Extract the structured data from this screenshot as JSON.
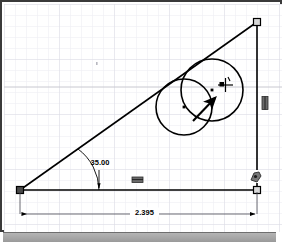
{
  "window": {
    "title": "sketch-canvas",
    "background_color": "#ffffff",
    "frame_color": "#3a3a3a",
    "grid_color": "#e8e8ee",
    "grid_major_color": "#d2d2dc",
    "geometry_color": "#000000",
    "statusbar_color": "#a8a8a8"
  },
  "grid": {
    "minor_spacing": 11,
    "major_spacing": 55,
    "visible": true
  },
  "sketch": {
    "entities": [
      {
        "name": "horizontal-line",
        "type": "line",
        "x1": 16,
        "y1": 186,
        "x2": 253,
        "y2": 186
      },
      {
        "name": "vertical-line",
        "type": "line",
        "x1": 253,
        "y1": 186,
        "x2": 253,
        "y2": 18
      },
      {
        "name": "hypotenuse-line",
        "type": "line",
        "x1": 16,
        "y1": 186,
        "x2": 253,
        "y2": 18
      },
      {
        "name": "left-circle",
        "type": "circle",
        "cx": 180,
        "cy": 103,
        "r": 28
      },
      {
        "name": "right-circle",
        "type": "circle",
        "cx": 208,
        "cy": 86,
        "r": 31
      }
    ],
    "points": [
      {
        "name": "origin-endpoint",
        "x": 16,
        "y": 186
      },
      {
        "name": "top-right-endpoint",
        "x": 253,
        "y": 18
      },
      {
        "name": "bottom-right-endpoint",
        "x": 253,
        "y": 186
      }
    ]
  },
  "dimensions": {
    "angle": {
      "label": "35.00",
      "value": 35.0,
      "units": "deg",
      "text_x": 96,
      "text_y": 160
    },
    "length": {
      "label": "2.395",
      "value": 2.395,
      "units": "in",
      "text_x": 140,
      "text_y": 212
    }
  },
  "relations": [
    {
      "name": "horizontal-relation-icon",
      "glyph": "horizontal",
      "x": 133,
      "y": 176
    },
    {
      "name": "vertical-relation-icon",
      "glyph": "vertical",
      "x": 261,
      "y": 99
    },
    {
      "name": "coincident-relation-icon",
      "glyph": "coincident",
      "x": 251,
      "y": 173
    }
  ],
  "cursor": {
    "name": "drag-arrow-cursor",
    "arrow_tail_x": 189,
    "arrow_tail_y": 116,
    "arrow_head_x": 213,
    "arrow_head_y": 93,
    "crosshair_x": 221,
    "crosshair_y": 81
  }
}
